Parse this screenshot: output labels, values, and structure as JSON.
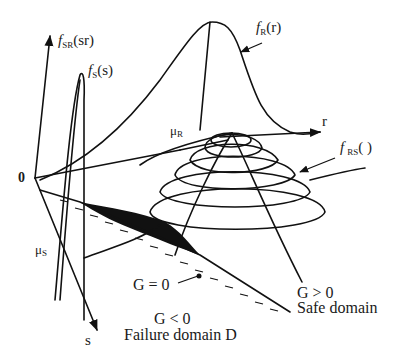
{
  "diagram": {
    "type": "3D joint probability density (stress-strength interference)",
    "labels": {
      "f_sr": {
        "main": "f",
        "sub": "SR",
        "arg": "(sr)"
      },
      "f_s": {
        "main": "f",
        "sub": "S",
        "arg": "(s)"
      },
      "f_r": {
        "main": "f",
        "sub": "R",
        "arg": "(r)"
      },
      "f_rs": {
        "main": "f",
        "sub": "RS",
        "arg": "( )"
      },
      "mu_r": {
        "main": "μ",
        "sub": "R"
      },
      "mu_s": {
        "main": "μ",
        "sub": "S"
      },
      "origin": "0",
      "r_axis": "r",
      "s_axis": "s",
      "g_zero": "G = 0",
      "g_neg": "G < 0",
      "failure_domain": "Failure domain D",
      "g_pos": "G > 0",
      "safe_domain": "Safe domain"
    },
    "colors": {
      "stroke": "#111111",
      "background": "#ffffff",
      "text": "#1a1a1a"
    }
  }
}
